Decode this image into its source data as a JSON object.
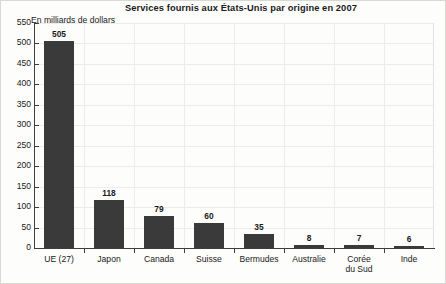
{
  "chart_data": {
    "type": "bar",
    "title": "Services fournis aux États-Unis par origine en 2007",
    "subtitle": "En milliards de dollars",
    "xlabel": "",
    "ylabel": "En milliards de dollars",
    "categories": [
      "UE (27)",
      "Japon",
      "Canada",
      "Suisse",
      "Bermudes",
      "Australie",
      "Corée du Sud",
      "Inde"
    ],
    "category_lines": [
      [
        "UE (27)"
      ],
      [
        "Japon"
      ],
      [
        "Canada"
      ],
      [
        "Suisse"
      ],
      [
        "Bermudes"
      ],
      [
        "Australie"
      ],
      [
        "Corée",
        "du Sud"
      ],
      [
        "Inde"
      ]
    ],
    "values": [
      505,
      118,
      79,
      60,
      35,
      8,
      7,
      6
    ],
    "value_labels": [
      "505",
      "118",
      "79",
      "60",
      "35",
      "8",
      "7",
      "6"
    ],
    "ylim": [
      0,
      550
    ],
    "yticks": [
      0,
      50,
      100,
      150,
      200,
      250,
      300,
      350,
      400,
      450,
      500,
      550
    ],
    "ytick_labels": [
      "0",
      "50",
      "100",
      "150",
      "200",
      "250",
      "300",
      "350",
      "400",
      "450",
      "500",
      "550"
    ],
    "grid": true,
    "legend": false,
    "bar_color": "#3a3a3a",
    "axis_color": "#3d3d3d",
    "grid_color": "#ececec",
    "background_color": "#fdfdfc",
    "text_color": "#1a1a1a"
  }
}
